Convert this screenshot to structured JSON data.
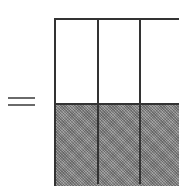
{
  "diagram": {
    "type": "fraction-area-model",
    "symbol": "=",
    "grid": {
      "columns_visible": 3,
      "rows": 2,
      "shaded_row": "bottom",
      "unshaded_row": "top",
      "colors": {
        "border": "#333333",
        "shaded": "#8a8a8a",
        "unshaded": "#ffffff"
      }
    }
  }
}
